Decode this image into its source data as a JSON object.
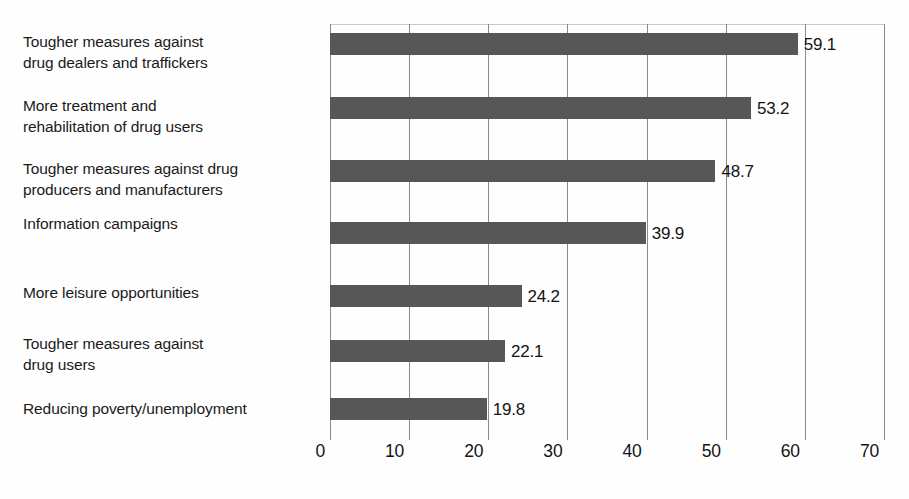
{
  "chart_data": {
    "type": "bar",
    "orientation": "horizontal",
    "title": "",
    "subtitle": "",
    "xlabel": "",
    "ylabel": "",
    "xlim": [
      0,
      70
    ],
    "xticks": [
      "0",
      "10",
      "20",
      "30",
      "40",
      "50",
      "60",
      "70"
    ],
    "xtick_values": [
      0,
      10,
      20,
      30,
      40,
      50,
      60,
      70
    ],
    "grid": true,
    "legend": false,
    "legend_position": "none",
    "bar_color": "#575757",
    "gridline_color": "#8a8a8a",
    "background_color": "#fefefe",
    "text_color": "#141414",
    "categories": [
      "Tougher measures against drug dealers and traffickers",
      "More treatment and rehabilitation of drug users",
      "Tougher measures against drug producers and manufacturers",
      "Information campaigns",
      "More leisure opportunities",
      "Tougher measures against drug users",
      "Reducing poverty/unemployment"
    ],
    "values": [
      59.1,
      53.2,
      48.7,
      39.9,
      24.2,
      22.1,
      19.8
    ],
    "value_labels": [
      "59.1",
      "53.2",
      "48.7",
      "39.9",
      "24.2",
      "22.1",
      "19.8"
    ],
    "bars": [
      {
        "label_lines": [
          "Tougher measures against",
          "drug dealers and traffickers"
        ],
        "value": 59.1,
        "value_label": "59.1"
      },
      {
        "label_lines": [
          "More treatment and",
          "rehabilitation of drug users"
        ],
        "value": 53.2,
        "value_label": "53.2"
      },
      {
        "label_lines": [
          "Tougher measures against drug",
          "producers and manufacturers"
        ],
        "value": 48.7,
        "value_label": "48.7"
      },
      {
        "label_lines": [
          "Information campaigns"
        ],
        "value": 39.9,
        "value_label": "39.9"
      },
      {
        "label_lines": [
          "More leisure opportunities"
        ],
        "value": 24.2,
        "value_label": "24.2"
      },
      {
        "label_lines": [
          "Tougher measures against",
          "drug users"
        ],
        "value": 22.1,
        "value_label": "22.1"
      },
      {
        "label_lines": [
          "Reducing poverty/unemployment"
        ],
        "value": 19.8,
        "value_label": "19.8"
      }
    ]
  }
}
